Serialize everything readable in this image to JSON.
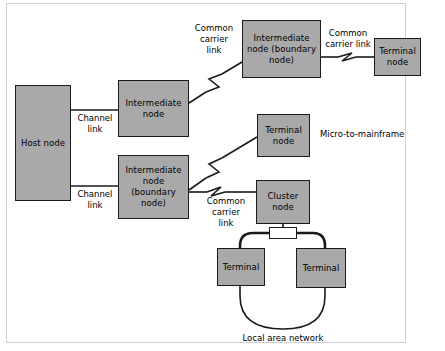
{
  "diagram": {
    "colors": {
      "node_fill": "#a9a9a9",
      "node_border": "#1a1a1a",
      "line": "#1a1a1a",
      "frame": "#cfcfcf",
      "background": "#ffffff"
    },
    "nodes": [
      {
        "id": "host",
        "label": "Host\nnode"
      },
      {
        "id": "intermediate-top",
        "label": "Intermediate\nnode"
      },
      {
        "id": "intermediate-boundary-left",
        "label": "Intermediate\nnode\n(boundary\nnode)"
      },
      {
        "id": "intermediate-boundary-top",
        "label": "Intermediate\nnode\n(boundary\nnode)"
      },
      {
        "id": "terminal-node-top",
        "label": "Terminal\nnode"
      },
      {
        "id": "terminal-node-mid",
        "label": "Terminal\nnode"
      },
      {
        "id": "cluster",
        "label": "Cluster\nnode"
      },
      {
        "id": "terminal-left",
        "label": "Terminal"
      },
      {
        "id": "terminal-right",
        "label": "Terminal"
      }
    ],
    "link_labels": {
      "channel_link_top": "Channel\nlink",
      "channel_link_bottom": "Channel\nlink",
      "common_carrier_link_upper": "Common\ncarrier\nlink",
      "common_carrier_link_top_right": "Common\ncarrier link",
      "common_carrier_link_lower": "Common\ncarrier\nlink"
    },
    "annotations": {
      "micro_to_mainframe": "Micro-to-mainframe",
      "local_area_network": "Local area network"
    }
  }
}
